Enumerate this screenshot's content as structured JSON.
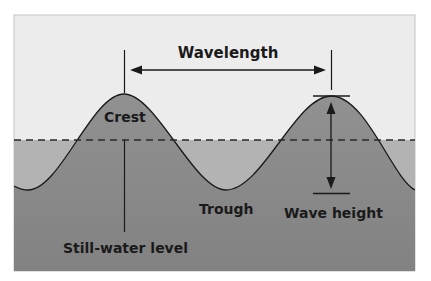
{
  "diagram": {
    "labels": {
      "wavelength": "Wavelength",
      "crest": "Crest",
      "trough": "Trough",
      "wave_height": "Wave height",
      "still_water_level": "Still-water level"
    },
    "colors": {
      "sky": "#ececec",
      "frame_border": "#bdbdbd",
      "still_water_band": "#b3b3b3",
      "wave_body_top": "#8f8f8f",
      "wave_body_bottom": "#838383",
      "line": "#1a1a1a"
    },
    "geometry": {
      "frame": {
        "x": 14,
        "y": 15,
        "width": 401,
        "height": 256
      },
      "still_water_y": 140,
      "crest_1": {
        "x": 124,
        "y": 94
      },
      "crest_2": {
        "x": 331,
        "y": 96
      },
      "trough_1": {
        "x": 28,
        "y": 190
      },
      "trough_2": {
        "x": 226,
        "y": 190
      },
      "wavelength_arrow_y": 70,
      "wave_height_top_y": 96,
      "wave_height_bottom_y": 193
    }
  }
}
